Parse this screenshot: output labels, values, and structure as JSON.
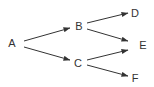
{
  "diagram": {
    "type": "tree",
    "colors": {
      "background": "#ffffff",
      "stroke": "#333333",
      "text": "#333333"
    },
    "nodes": [
      {
        "id": "A",
        "label": "A",
        "x": 12,
        "y": 47
      },
      {
        "id": "B",
        "label": "B",
        "x": 79,
        "y": 30
      },
      {
        "id": "C",
        "label": "C",
        "x": 78,
        "y": 67
      },
      {
        "id": "D",
        "label": "D",
        "x": 135,
        "y": 17
      },
      {
        "id": "E",
        "label": "E",
        "x": 143,
        "y": 49
      },
      {
        "id": "F",
        "label": "F",
        "x": 135,
        "y": 82
      }
    ],
    "edges": [
      {
        "from": "A",
        "to": "B",
        "x1": 24,
        "y1": 41,
        "x2": 70,
        "y2": 28
      },
      {
        "from": "A",
        "to": "C",
        "x1": 24,
        "y1": 47,
        "x2": 70,
        "y2": 60
      },
      {
        "from": "B",
        "to": "D",
        "x1": 87,
        "y1": 23,
        "x2": 128,
        "y2": 13
      },
      {
        "from": "B",
        "to": "E",
        "x1": 87,
        "y1": 29,
        "x2": 128,
        "y2": 41
      },
      {
        "from": "C",
        "to": "E",
        "x1": 87,
        "y1": 60,
        "x2": 128,
        "y2": 50
      },
      {
        "from": "C",
        "to": "F",
        "x1": 87,
        "y1": 65,
        "x2": 128,
        "y2": 76
      }
    ]
  }
}
